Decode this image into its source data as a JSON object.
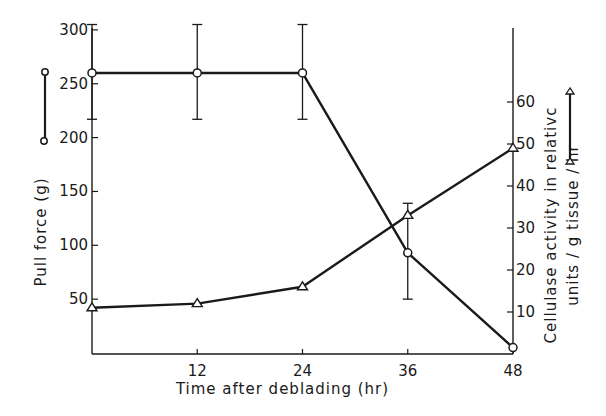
{
  "chart_data": {
    "type": "line",
    "title": "",
    "xlabel": "Time after deblading (hr)",
    "ylabel": "Pull force (g)",
    "y2label_line1": "Cellulase activity in relativc",
    "y2label_line2": "units / g tissue / hr",
    "x": [
      0,
      12,
      24,
      36,
      48
    ],
    "xticks": [
      "12",
      "24",
      "36",
      "48"
    ],
    "xlim": [
      0,
      48
    ],
    "ylim": [
      0,
      300
    ],
    "yticks": [
      "50",
      "100",
      "150",
      "200",
      "250",
      "300"
    ],
    "y2lim": [
      0,
      65
    ],
    "y2ticks": [
      "10",
      "20",
      "30",
      "40",
      "50",
      "60"
    ],
    "grid": false,
    "legend_position": "axis-side symbols (left: circle line, right: triangle line)",
    "series": [
      {
        "name": "Pull force",
        "axis": "left",
        "marker": "circle",
        "values": [
          260,
          260,
          260,
          93,
          5
        ],
        "error_low": [
          217,
          217,
          217,
          50,
          null
        ],
        "error_high": [
          305,
          305,
          305,
          139,
          null
        ]
      },
      {
        "name": "Cellulase activity",
        "axis": "right",
        "marker": "triangle",
        "values": [
          11,
          12,
          16,
          33,
          49
        ]
      }
    ]
  }
}
